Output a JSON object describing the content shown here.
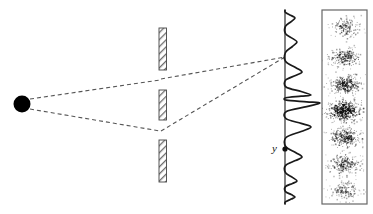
{
  "figure": {
    "background_color": "#ffffff",
    "width": 373,
    "height": 214
  },
  "labels": {
    "position_label": "y"
  },
  "colors": {
    "stroke": "#1a1a1a",
    "dashed_ray": "#555555",
    "barrier_outline": "#444444",
    "barrier_hatch": "#777777",
    "panel_border": "#666666",
    "speckle": "#111111",
    "source_fill": "#000000"
  },
  "source": {
    "name": "point-source",
    "cx": 22,
    "cy": 104,
    "r": 8.5
  },
  "barriers": {
    "x": 159,
    "width": 7.5,
    "segments": [
      {
        "name": "barrier-top",
        "y_top": 28,
        "y_bottom": 70
      },
      {
        "name": "barrier-middle",
        "y_top": 90,
        "y_bottom": 120
      },
      {
        "name": "barrier-bottom",
        "y_top": 140,
        "y_bottom": 182
      }
    ],
    "slits": [
      {
        "name": "slit-upper",
        "y": 80
      },
      {
        "name": "slit-lower",
        "y": 130
      }
    ]
  },
  "rays": [
    {
      "name": "ray-source-to-upper-slit",
      "x1": 30,
      "y1": 99,
      "x2": 160,
      "y2": 80
    },
    {
      "name": "ray-source-to-lower-slit",
      "x1": 30,
      "y1": 109,
      "x2": 160,
      "y2": 131
    },
    {
      "name": "ray-upper-slit-to-screen",
      "x1": 161,
      "y1": 79,
      "x2": 285,
      "y2": 57
    },
    {
      "name": "ray-lower-slit-to-screen",
      "x1": 161,
      "y1": 131,
      "x2": 285,
      "y2": 57
    }
  ],
  "screen_axis": {
    "name": "screen-axis-line",
    "x": 285,
    "y_top": 10,
    "y_bottom": 204
  },
  "marker": {
    "name": "position-marker-dot",
    "cx": 285,
    "cy": 149,
    "r": 2.6,
    "label_x": 272,
    "label_y": 152
  },
  "chart_data": {
    "type": "line",
    "orientation": "vertical",
    "xlabel": "Intensity",
    "ylabel": "y",
    "baseline_x": 285,
    "y": [
      10,
      18,
      26,
      34,
      42,
      50,
      57,
      64,
      72,
      80,
      88,
      95,
      103,
      111,
      119,
      127,
      134,
      142,
      149,
      157,
      165,
      173,
      181,
      189,
      197,
      204
    ],
    "intensity": [
      2,
      10,
      3,
      1,
      12,
      4,
      1,
      17,
      6,
      1,
      26,
      8,
      35,
      8,
      1,
      26,
      6,
      1,
      17,
      4,
      1,
      12,
      3,
      10,
      2,
      1
    ],
    "peak_amplitudes_px": [
      10,
      12,
      17,
      26,
      35,
      26,
      17,
      12,
      10
    ],
    "peak_positions_y": [
      18,
      42,
      72,
      95,
      103,
      127,
      157,
      181,
      197
    ],
    "central_maximum_y": 103,
    "max_amplitude_px": 35,
    "ylim": [
      10,
      204
    ],
    "grid": false,
    "legend": false
  },
  "detection_panel": {
    "name": "detection-screen-panel",
    "x": 322,
    "y": 10,
    "width": 45,
    "height": 194,
    "fringe_count": 7,
    "fringes": [
      {
        "name": "fringe-1",
        "cy": 27,
        "rx": 17,
        "ry": 11,
        "density": 0.42,
        "dots": 150
      },
      {
        "name": "fringe-2",
        "cy": 57,
        "rx": 18,
        "ry": 11,
        "density": 0.58,
        "dots": 210
      },
      {
        "name": "fringe-3",
        "cy": 84,
        "rx": 18,
        "ry": 11,
        "density": 0.72,
        "dots": 270
      },
      {
        "name": "fringe-4",
        "cy": 110,
        "rx": 20,
        "ry": 12,
        "density": 1.0,
        "dots": 400
      },
      {
        "name": "fringe-5",
        "cy": 137,
        "rx": 18,
        "ry": 11,
        "density": 0.68,
        "dots": 255
      },
      {
        "name": "fringe-6",
        "cy": 164,
        "rx": 18,
        "ry": 11,
        "density": 0.58,
        "dots": 210
      },
      {
        "name": "fringe-7",
        "cy": 190,
        "rx": 17,
        "ry": 10,
        "density": 0.4,
        "dots": 145
      }
    ]
  }
}
